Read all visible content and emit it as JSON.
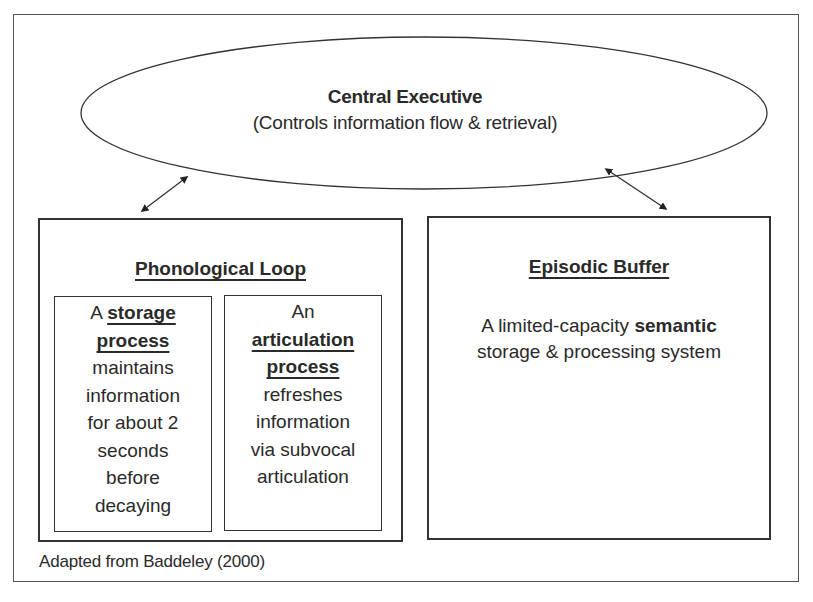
{
  "diagram": {
    "central_executive": {
      "title": "Central Executive",
      "subtitle": "(Controls information flow & retrieval)"
    },
    "phonological_loop": {
      "title": "Phonological Loop",
      "storage": {
        "prefix": "A",
        "bold1": "storage",
        "bold2": "process",
        "lines": [
          "maintains",
          "information",
          "for about 2",
          "seconds",
          "before",
          "decaying"
        ]
      },
      "articulation": {
        "prefix": "An",
        "bold1": "articulation",
        "bold2": "process",
        "lines": [
          "refreshes",
          "information",
          "via subvocal",
          "articulation"
        ]
      }
    },
    "episodic_buffer": {
      "title": "Episodic Buffer",
      "desc_pre": "A limited-capacity ",
      "desc_bold": "semantic",
      "desc_line2": "storage & processing system"
    },
    "caption": "Adapted from Baddeley (2000)",
    "connections": [
      {
        "from": "Central Executive",
        "to": "Phonological Loop",
        "type": "bidirectional"
      },
      {
        "from": "Central Executive",
        "to": "Episodic Buffer",
        "type": "bidirectional"
      }
    ]
  }
}
